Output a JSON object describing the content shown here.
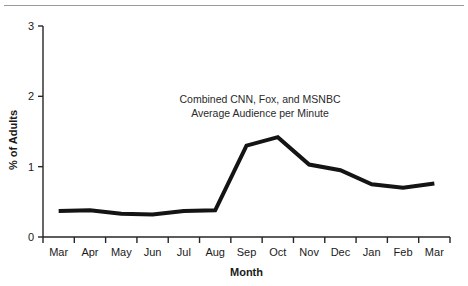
{
  "figure": {
    "name": "line-chart-cable-news-audience",
    "top_rule_color": "#9a9a9a",
    "background": "#ffffff",
    "line_color": "#141414"
  },
  "annotation": {
    "line1": "Combined CNN, Fox, and MSNBC",
    "line2": "Average Audience per Minute"
  },
  "axes": {
    "ylabel": "% of Adults",
    "xlabel": "Month",
    "yticks": [
      "0",
      "1",
      "2",
      "3"
    ],
    "xticklabels": [
      "Mar",
      "Apr",
      "May",
      "Jun",
      "Jul",
      "Aug",
      "Sep",
      "Oct",
      "Nov",
      "Dec",
      "Jan",
      "Feb",
      "Mar"
    ]
  },
  "chart_data": {
    "type": "line",
    "title": "",
    "subtitle": "",
    "xlabel": "Month",
    "ylabel": "% of Adults",
    "categories": [
      "Mar",
      "Apr",
      "May",
      "Jun",
      "Jul",
      "Aug",
      "Sep",
      "Oct",
      "Nov",
      "Dec",
      "Jan",
      "Feb",
      "Mar"
    ],
    "values": [
      0.37,
      0.38,
      0.33,
      0.32,
      0.37,
      0.38,
      1.3,
      1.42,
      1.03,
      0.95,
      0.75,
      0.7,
      0.76
    ],
    "ylim": [
      0,
      3
    ],
    "yticks": [
      0,
      1,
      2,
      3
    ],
    "grid": false,
    "legend": false,
    "annotations": [
      "Combined CNN, Fox, and MSNBC",
      "Average Audience per Minute"
    ],
    "series_name": "Combined CNN, Fox, and MSNBC Average Audience per Minute",
    "line_color": "#141414",
    "line_width": 4
  }
}
